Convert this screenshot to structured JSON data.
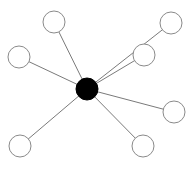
{
  "diagram": {
    "type": "star-graph",
    "width": 196,
    "height": 169,
    "colors": {
      "background": "#ffffff",
      "hub_fill": "#000000",
      "leaf_fill": "#ffffff",
      "leaf_stroke": "#8a8a8a",
      "edge": "#7a7a7a"
    },
    "hub": {
      "id": "hub",
      "cx": 87,
      "cy": 89,
      "r": 11
    },
    "leaves": [
      {
        "id": "leaf-top-left",
        "cx": 54,
        "cy": 22,
        "r": 11
      },
      {
        "id": "leaf-top-right",
        "cx": 171,
        "cy": 23,
        "r": 11
      },
      {
        "id": "leaf-left",
        "cx": 19,
        "cy": 57,
        "r": 11
      },
      {
        "id": "leaf-inner-right",
        "cx": 144,
        "cy": 55,
        "r": 11
      },
      {
        "id": "leaf-right",
        "cx": 174,
        "cy": 112,
        "r": 11
      },
      {
        "id": "leaf-bottom-left",
        "cx": 20,
        "cy": 146,
        "r": 11
      },
      {
        "id": "leaf-bottom-right",
        "cx": 143,
        "cy": 146,
        "r": 11
      }
    ],
    "edges": [
      {
        "from": "hub",
        "to": "leaf-top-left"
      },
      {
        "from": "hub",
        "to": "leaf-top-right"
      },
      {
        "from": "hub",
        "to": "leaf-left"
      },
      {
        "from": "hub",
        "to": "leaf-inner-right"
      },
      {
        "from": "hub",
        "to": "leaf-right"
      },
      {
        "from": "hub",
        "to": "leaf-bottom-left"
      },
      {
        "from": "hub",
        "to": "leaf-bottom-right"
      }
    ]
  }
}
